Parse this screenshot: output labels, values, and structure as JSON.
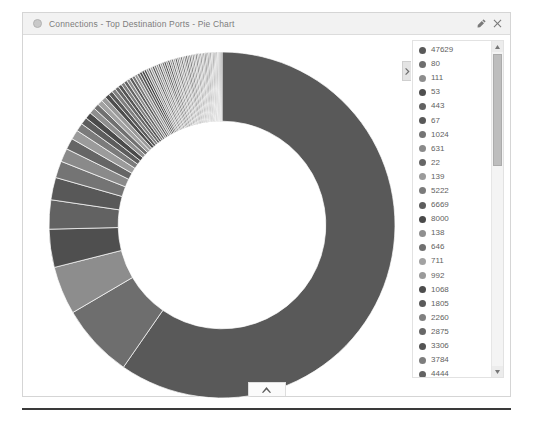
{
  "window": {
    "title": "Connections - Top Destination Ports - Pie Chart",
    "icon": "pie-chart-icon",
    "buttons": [
      {
        "name": "edit-button",
        "glyph": "pencil"
      },
      {
        "name": "close-button",
        "glyph": "times"
      }
    ]
  },
  "legend": {
    "collapse_handle": "chevron-right",
    "scroll_up": "scroll-up-arrow",
    "scroll_down": "scroll-down-arrow",
    "items": [
      {
        "label": "47629",
        "color": "#595959"
      },
      {
        "label": "80",
        "color": "#6e6e6e"
      },
      {
        "label": "111",
        "color": "#8d8d8d"
      },
      {
        "label": "53",
        "color": "#4f4f4f"
      },
      {
        "label": "443",
        "color": "#626262"
      },
      {
        "label": "67",
        "color": "#585858"
      },
      {
        "label": "1024",
        "color": "#747474"
      },
      {
        "label": "631",
        "color": "#8a8a8a"
      },
      {
        "label": "22",
        "color": "#666666"
      },
      {
        "label": "139",
        "color": "#9b9b9b"
      },
      {
        "label": "5222",
        "color": "#7b7b7b"
      },
      {
        "label": "6669",
        "color": "#5d5d5d"
      },
      {
        "label": "8000",
        "color": "#4a4a4a"
      },
      {
        "label": "138",
        "color": "#8f8f8f"
      },
      {
        "label": "646",
        "color": "#707070"
      },
      {
        "label": "711",
        "color": "#a2a2a2"
      },
      {
        "label": "992",
        "color": "#9a9a9a"
      },
      {
        "label": "1068",
        "color": "#4d4d4d"
      },
      {
        "label": "1805",
        "color": "#5a5a5a"
      },
      {
        "label": "2260",
        "color": "#808080"
      },
      {
        "label": "2875",
        "color": "#676767"
      },
      {
        "label": "3306",
        "color": "#545454"
      },
      {
        "label": "3784",
        "color": "#7d7d7d"
      },
      {
        "label": "4444",
        "color": "#636363"
      },
      {
        "label": "5050",
        "color": "#8b8b8b"
      },
      {
        "label": "5800",
        "color": "#5b5b5b"
      },
      {
        "label": "5962",
        "color": "#757575"
      },
      {
        "label": "5998",
        "color": "#959595"
      },
      {
        "label": "7002",
        "color": "#6a6a6a"
      },
      {
        "label": "9535",
        "color": "#515151"
      },
      {
        "label": "16992",
        "color": "#484848"
      }
    ]
  },
  "bottom_tab": {
    "glyph": "chevron-up"
  },
  "chart_data": {
    "type": "pie",
    "variant": "donut",
    "title": "Connections - Top Destination Ports - Pie Chart",
    "xlabel": "",
    "ylabel": "",
    "legend_position": "right",
    "start_angle_deg": -90,
    "direction": "clockwise",
    "inner_radius_ratio": 0.6,
    "labels": [
      "47629",
      "80",
      "111",
      "53",
      "443",
      "67",
      "1024",
      "631",
      "22",
      "139",
      "5222",
      "6669",
      "8000",
      "138",
      "646",
      "711",
      "992",
      "1068",
      "1805",
      "2260",
      "2875",
      "3306",
      "3784",
      "4444",
      "5050",
      "5800",
      "5962",
      "5998",
      "7002",
      "9535",
      "16992"
    ],
    "values": [
      57.0,
      6.6,
      4.3,
      3.4,
      2.6,
      2.0,
      1.5,
      1.2,
      1.0,
      0.85,
      0.72,
      0.64,
      0.58,
      0.53,
      0.49,
      0.46,
      0.43,
      0.4,
      0.38,
      0.36,
      0.34,
      0.32,
      0.3,
      0.29,
      0.28,
      0.27,
      0.26,
      0.25,
      0.24,
      0.23,
      0.22
    ],
    "colors": [
      "#595959",
      "#6e6e6e",
      "#8d8d8d",
      "#4f4f4f",
      "#626262",
      "#585858",
      "#747474",
      "#8a8a8a",
      "#666666",
      "#9b9b9b",
      "#7b7b7b",
      "#5d5d5d",
      "#4a4a4a",
      "#8f8f8f",
      "#707070",
      "#a2a2a2",
      "#9a9a9a",
      "#4d4d4d",
      "#5a5a5a",
      "#808080",
      "#676767",
      "#545454",
      "#7d7d7d",
      "#636363",
      "#8b8b8b",
      "#5b5b5b",
      "#757575",
      "#959595",
      "#6a6a6a",
      "#515151",
      "#484848"
    ],
    "extra_thin_slices": 48,
    "unit": "connections"
  }
}
